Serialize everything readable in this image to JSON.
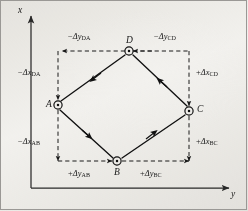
{
  "figure": {
    "background_color": "#f3f2ef",
    "ink_color": "#1a1a1a"
  },
  "axes": {
    "vertical": {
      "label": "x",
      "name": "x-axis",
      "direction": "up"
    },
    "horizontal": {
      "label": "y",
      "name": "y-axis",
      "direction": "right"
    }
  },
  "stations": [
    {
      "id": "A",
      "label": "A",
      "x": 58,
      "y": 105,
      "marker": "circled-dot"
    },
    {
      "id": "B",
      "label": "B",
      "x": 117,
      "y": 161,
      "marker": "circled-dot"
    },
    {
      "id": "C",
      "label": "C",
      "x": 189,
      "y": 111,
      "marker": "circled-dot"
    },
    {
      "id": "D",
      "label": "D",
      "x": 129,
      "y": 51,
      "marker": "circled-dot"
    }
  ],
  "courses": [
    {
      "from": "A",
      "to": "B"
    },
    {
      "from": "B",
      "to": "C"
    },
    {
      "from": "C",
      "to": "D"
    },
    {
      "from": "D",
      "to": "A"
    }
  ],
  "dimensions": {
    "top_left": {
      "sign": "−",
      "delta": "Δ",
      "var": "y",
      "sub": "DA",
      "text": "−ΔyDA"
    },
    "top_right": {
      "sign": "−",
      "delta": "Δ",
      "var": "y",
      "sub": "CD",
      "text": "−ΔyCD"
    },
    "left_upper": {
      "sign": "−",
      "delta": "Δ",
      "var": "x",
      "sub": "DA",
      "text": "−ΔxDA"
    },
    "left_lower": {
      "sign": "−",
      "delta": "Δ",
      "var": "x",
      "sub": "AB",
      "text": "−ΔxAB"
    },
    "right_upper": {
      "sign": "+",
      "delta": "Δ",
      "var": "x",
      "sub": "CD",
      "text": "+ΔxCD"
    },
    "right_lower": {
      "sign": "+",
      "delta": "Δ",
      "var": "x",
      "sub": "BC",
      "text": "+ΔxBC"
    },
    "bottom_left": {
      "sign": "+",
      "delta": "Δ",
      "var": "y",
      "sub": "AB",
      "text": "+ΔyAB"
    },
    "bottom_right": {
      "sign": "+",
      "delta": "Δ",
      "var": "y",
      "sub": "BC",
      "text": "+ΔyBC"
    }
  }
}
